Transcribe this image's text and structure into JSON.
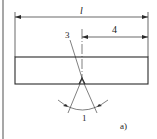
{
  "figure": {
    "sublabel": "a)",
    "dimension_overall": "l",
    "dimension_offset": "4",
    "callout_3": "3",
    "callout_1": "1"
  },
  "colors": {
    "line": "#2a2a2a",
    "border": "#8a8a8a",
    "background": "#ffffff"
  }
}
